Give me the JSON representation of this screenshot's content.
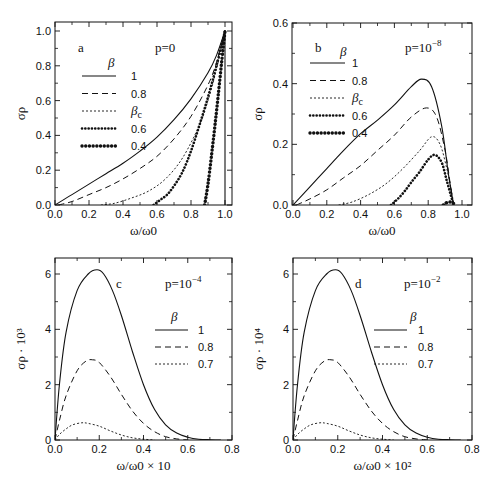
{
  "chart_data": [
    {
      "id": "a",
      "type": "line",
      "panel_label": "a",
      "annotation": "p=0",
      "xlabel": "ω/ω0",
      "ylabel": "σρ",
      "xlim": [
        0,
        1.05
      ],
      "ylim": [
        0,
        1.05
      ],
      "xticks": [
        "0.0",
        "0.2",
        "0.4",
        "0.6",
        "0.8",
        "1.0"
      ],
      "yticks": [
        "0.0",
        "0.2",
        "0.4",
        "0.6",
        "0.8",
        "1.0"
      ],
      "legend_title": "β",
      "legend": [
        {
          "label": "1",
          "style": "solid"
        },
        {
          "label": "0.8",
          "style": "dashed"
        },
        {
          "label": "βc",
          "style": "dotted"
        },
        {
          "label": "0.6",
          "style": "dots-medium"
        },
        {
          "label": "0.4",
          "style": "dots-heavy"
        }
      ],
      "series": [
        {
          "name": "1",
          "x": [
            0,
            0.1,
            0.2,
            0.3,
            0.4,
            0.5,
            0.6,
            0.7,
            0.8,
            0.9,
            0.95,
            1.0
          ],
          "y": [
            0,
            0.06,
            0.12,
            0.18,
            0.24,
            0.31,
            0.39,
            0.49,
            0.61,
            0.76,
            0.86,
            1.0
          ]
        },
        {
          "name": "0.8",
          "x": [
            0.02,
            0.1,
            0.2,
            0.3,
            0.4,
            0.5,
            0.6,
            0.7,
            0.8,
            0.9,
            0.95,
            1.0
          ],
          "y": [
            0,
            0.02,
            0.06,
            0.1,
            0.15,
            0.21,
            0.28,
            0.38,
            0.51,
            0.69,
            0.82,
            1.0
          ]
        },
        {
          "name": "βc",
          "x": [
            0.27,
            0.35,
            0.45,
            0.55,
            0.65,
            0.75,
            0.85,
            0.9,
            0.95,
            1.0
          ],
          "y": [
            0,
            0.01,
            0.04,
            0.08,
            0.15,
            0.27,
            0.46,
            0.6,
            0.78,
            1.0
          ]
        },
        {
          "name": "0.6",
          "x": [
            0.58,
            0.62,
            0.66,
            0.7,
            0.75,
            0.8,
            0.85,
            0.9,
            0.95,
            1.0
          ],
          "y": [
            0,
            0.03,
            0.06,
            0.11,
            0.19,
            0.31,
            0.46,
            0.62,
            0.8,
            1.0
          ]
        },
        {
          "name": "0.4",
          "x": [
            0.88,
            0.9,
            0.92,
            0.94,
            0.96,
            0.98,
            1.0
          ],
          "y": [
            0,
            0.12,
            0.28,
            0.45,
            0.63,
            0.82,
            1.0
          ]
        }
      ],
      "extra": "vertical line at ω/ω0=1.0"
    },
    {
      "id": "b",
      "type": "line",
      "panel_label": "b",
      "annotation": "p=10",
      "annotation_exp": "−8",
      "xlabel": "ω/ω0",
      "ylabel": "σρ",
      "xlim": [
        0,
        1.05
      ],
      "ylim": [
        0,
        0.6
      ],
      "xticks": [
        "0.0",
        "0.2",
        "0.4",
        "0.6",
        "0.8",
        "1.0"
      ],
      "yticks": [
        "0.0",
        "0.2",
        "0.4",
        "0.6"
      ],
      "legend_title": "β",
      "legend": [
        {
          "label": "1",
          "style": "solid"
        },
        {
          "label": "0.8",
          "style": "dashed"
        },
        {
          "label": "βc",
          "style": "dotted"
        },
        {
          "label": "0.6",
          "style": "dots-medium"
        },
        {
          "label": "0.4",
          "style": "dots-heavy"
        }
      ],
      "series": [
        {
          "name": "1",
          "x": [
            0,
            0.1,
            0.2,
            0.3,
            0.4,
            0.5,
            0.6,
            0.7,
            0.76,
            0.82,
            0.88,
            0.92,
            0.95
          ],
          "y": [
            0,
            0.06,
            0.12,
            0.18,
            0.235,
            0.28,
            0.33,
            0.39,
            0.415,
            0.39,
            0.26,
            0.1,
            0
          ]
        },
        {
          "name": "0.8",
          "x": [
            0.02,
            0.1,
            0.2,
            0.3,
            0.4,
            0.5,
            0.6,
            0.7,
            0.79,
            0.85,
            0.9,
            0.93,
            0.95
          ],
          "y": [
            0,
            0.02,
            0.05,
            0.09,
            0.13,
            0.18,
            0.23,
            0.29,
            0.32,
            0.29,
            0.18,
            0.07,
            0
          ]
        },
        {
          "name": "βc",
          "x": [
            0.27,
            0.35,
            0.45,
            0.55,
            0.65,
            0.75,
            0.82,
            0.87,
            0.91,
            0.94,
            0.95
          ],
          "y": [
            0,
            0.01,
            0.035,
            0.07,
            0.12,
            0.18,
            0.225,
            0.2,
            0.12,
            0.04,
            0
          ]
        },
        {
          "name": "0.6",
          "x": [
            0.58,
            0.62,
            0.66,
            0.7,
            0.75,
            0.8,
            0.84,
            0.88,
            0.91,
            0.94,
            0.95
          ],
          "y": [
            0,
            0.02,
            0.045,
            0.075,
            0.11,
            0.15,
            0.165,
            0.14,
            0.08,
            0.02,
            0
          ]
        },
        {
          "name": "0.4",
          "x": [
            0.89,
            0.91,
            0.93,
            0.95,
            0.96
          ],
          "y": [
            0,
            0.008,
            0.01,
            0.005,
            0
          ]
        }
      ]
    },
    {
      "id": "c",
      "type": "line",
      "panel_label": "c",
      "annotation": "p=10",
      "annotation_exp": "−4",
      "xlabel": "ω/ω0 × 10",
      "ylabel": "σρ · 10³",
      "xlim": [
        0,
        0.8
      ],
      "ylim": [
        0,
        6.6
      ],
      "xticks": [
        "0.0",
        "0.2",
        "0.4",
        "0.6",
        "0.8"
      ],
      "yticks": [
        "0",
        "2",
        "4",
        "6"
      ],
      "legend_title": "β",
      "legend": [
        {
          "label": "1",
          "style": "solid"
        },
        {
          "label": "0.8",
          "style": "dashed"
        },
        {
          "label": "0.7",
          "style": "dotted"
        }
      ],
      "series": [
        {
          "name": "1",
          "x": [
            0,
            0.02,
            0.05,
            0.1,
            0.15,
            0.19,
            0.22,
            0.26,
            0.3,
            0.35,
            0.4,
            0.45,
            0.5,
            0.55,
            0.6,
            0.65,
            0.7,
            0.75
          ],
          "y": [
            0,
            2.0,
            3.9,
            5.4,
            6.0,
            6.15,
            6.0,
            5.4,
            4.5,
            3.2,
            2.0,
            1.1,
            0.55,
            0.25,
            0.1,
            0.03,
            0.01,
            0
          ]
        },
        {
          "name": "0.8",
          "x": [
            0,
            0.02,
            0.05,
            0.1,
            0.14,
            0.17,
            0.2,
            0.25,
            0.3,
            0.35,
            0.4,
            0.45,
            0.5,
            0.55,
            0.6
          ],
          "y": [
            0,
            0.7,
            1.6,
            2.5,
            2.85,
            2.9,
            2.8,
            2.3,
            1.65,
            1.05,
            0.6,
            0.3,
            0.12,
            0.04,
            0
          ]
        },
        {
          "name": "0.7",
          "x": [
            0,
            0.02,
            0.05,
            0.08,
            0.12,
            0.15,
            0.2,
            0.25,
            0.3,
            0.35,
            0.4,
            0.45
          ],
          "y": [
            0,
            0.2,
            0.4,
            0.55,
            0.62,
            0.6,
            0.5,
            0.33,
            0.18,
            0.08,
            0.03,
            0
          ]
        }
      ]
    },
    {
      "id": "d",
      "type": "line",
      "panel_label": "d",
      "annotation": "p=10",
      "annotation_exp": "−2",
      "xlabel": "ω/ω0 × 10²",
      "ylabel": "σρ · 10⁴",
      "xlim": [
        0,
        0.8
      ],
      "ylim": [
        0,
        6.6
      ],
      "xticks": [
        "0.0",
        "0.2",
        "0.4",
        "0.6",
        "0.8"
      ],
      "yticks": [
        "0",
        "2",
        "4",
        "6"
      ],
      "legend_title": "β",
      "legend": [
        {
          "label": "1",
          "style": "solid"
        },
        {
          "label": "0.8",
          "style": "dashed"
        },
        {
          "label": "0.7",
          "style": "dotted"
        }
      ],
      "series": [
        {
          "name": "1",
          "x": [
            0,
            0.02,
            0.05,
            0.1,
            0.15,
            0.19,
            0.22,
            0.26,
            0.3,
            0.35,
            0.4,
            0.45,
            0.5,
            0.55,
            0.6,
            0.65,
            0.7,
            0.75
          ],
          "y": [
            0,
            2.0,
            3.9,
            5.4,
            6.0,
            6.15,
            6.0,
            5.4,
            4.5,
            3.2,
            2.0,
            1.1,
            0.55,
            0.25,
            0.1,
            0.03,
            0.01,
            0
          ]
        },
        {
          "name": "0.8",
          "x": [
            0,
            0.02,
            0.05,
            0.1,
            0.14,
            0.17,
            0.2,
            0.25,
            0.3,
            0.35,
            0.4,
            0.45,
            0.5,
            0.55,
            0.6
          ],
          "y": [
            0,
            0.7,
            1.6,
            2.5,
            2.85,
            2.9,
            2.8,
            2.3,
            1.65,
            1.05,
            0.6,
            0.3,
            0.12,
            0.04,
            0
          ]
        },
        {
          "name": "0.7",
          "x": [
            0,
            0.02,
            0.05,
            0.08,
            0.12,
            0.15,
            0.2,
            0.25,
            0.3,
            0.35,
            0.4,
            0.45
          ],
          "y": [
            0,
            0.2,
            0.4,
            0.55,
            0.62,
            0.6,
            0.5,
            0.33,
            0.18,
            0.08,
            0.03,
            0
          ]
        }
      ]
    }
  ],
  "layout": {
    "panels": [
      {
        "id": "a",
        "frame": [
          55,
          22,
          232,
          205
        ],
        "x0": 55,
        "x1": 225,
        "xv1": 1.0,
        "y0": 205,
        "y1": 31,
        "yv1": 1.0,
        "xmaxv": 1.05,
        "label_pos": [
          78,
          52
        ],
        "annot_pos": [
          155,
          52
        ],
        "legend": {
          "title": [
            108,
            67
          ],
          "x": 82,
          "y": 80,
          "dy": 17.5,
          "linew": 34,
          "textx": 131
        }
      },
      {
        "id": "b",
        "frame": [
          292,
          23,
          472,
          205
        ],
        "x0": 293,
        "x1": 462,
        "xv1": 1.0,
        "y0": 205,
        "y1": 23,
        "yv1": 0.6,
        "xmaxv": 1.05,
        "label_pos": [
          315,
          52
        ],
        "annot_pos": [
          405,
          52
        ],
        "legend": {
          "title": [
            340,
            56
          ],
          "x": 310,
          "y": 67,
          "dy": 17.5,
          "linew": 35,
          "textx": 352
        }
      },
      {
        "id": "c",
        "frame": [
          55,
          258,
          232,
          440
        ],
        "x0": 55,
        "x1": 232,
        "xv1": 0.8,
        "y0": 440,
        "y1": 274,
        "yv1": 6.0,
        "xmaxv": 0.8,
        "label_pos": [
          116,
          288
        ],
        "annot_pos": [
          165,
          288
        ],
        "legend": {
          "title": [
            171,
            321
          ],
          "x": 155,
          "y": 334,
          "dy": 17,
          "linew": 33,
          "textx": 198
        }
      },
      {
        "id": "d",
        "frame": [
          293,
          258,
          472,
          440
        ],
        "x0": 293,
        "x1": 472,
        "xv1": 0.8,
        "y0": 440,
        "y1": 274,
        "yv1": 6.0,
        "xmaxv": 0.8,
        "label_pos": [
          355,
          288
        ],
        "annot_pos": [
          404,
          288
        ],
        "legend": {
          "title": [
            410,
            321
          ],
          "x": 374,
          "y": 334,
          "dy": 17,
          "linew": 33,
          "textx": 418
        }
      }
    ],
    "styles": {
      "solid": {
        "dash": "",
        "width": 1.1,
        "cap": "butt"
      },
      "dashed": {
        "dash": "6 4",
        "width": 1.0,
        "cap": "butt"
      },
      "dotted": {
        "dash": "2 2",
        "width": 0.9,
        "cap": "butt"
      },
      "dots-medium": {
        "dash": "0.1 3.2",
        "width": 2.6,
        "cap": "round"
      },
      "dots-heavy": {
        "dash": "0.1 3.6",
        "width": 3.4,
        "cap": "round"
      }
    },
    "ink": "#111111"
  }
}
